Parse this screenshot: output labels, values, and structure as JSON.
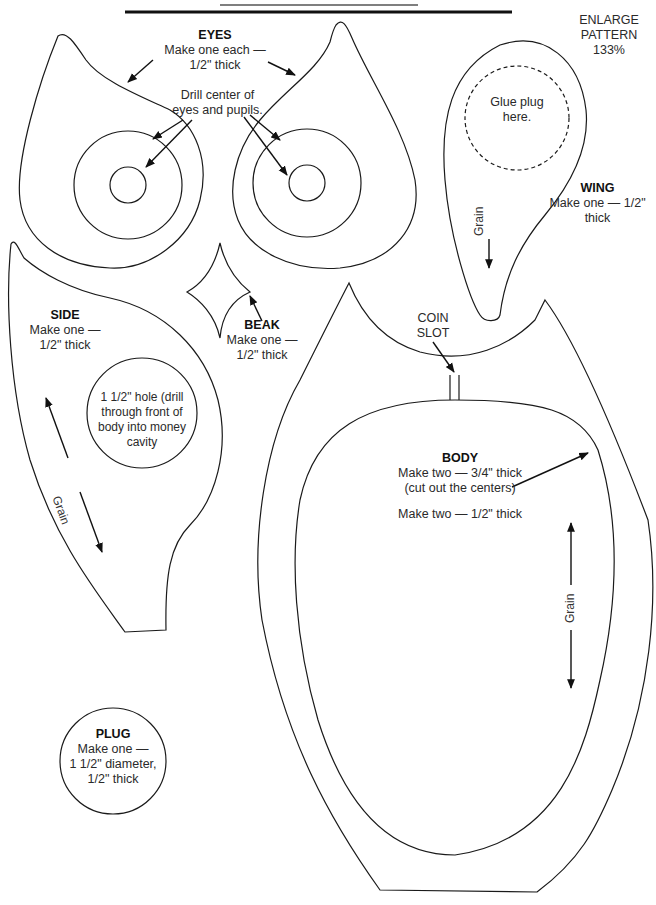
{
  "header": {
    "enlarge_note": [
      "ENLARGE",
      "PATTERN",
      "133%"
    ]
  },
  "pieces": {
    "eyes": {
      "title": "EYES",
      "lines": [
        "Make one each —",
        "1/2\" thick"
      ],
      "drill_note": [
        "Drill center of",
        "eyes and pupils."
      ]
    },
    "wing": {
      "title": "WING",
      "lines": [
        "Make one — 1/2\"",
        "thick"
      ],
      "glue_note": [
        "Glue plug",
        "here."
      ],
      "grain": "Grain"
    },
    "side": {
      "title": "SIDE",
      "lines": [
        "Make one —",
        "1/2\" thick"
      ],
      "hole_note": [
        "1 1/2\" hole (drill",
        "through front of",
        "body into money",
        "cavity"
      ],
      "grain": "Grain"
    },
    "beak": {
      "title": "BEAK",
      "lines": [
        "Make one —",
        "1/2\" thick"
      ]
    },
    "coin_slot": {
      "lines": [
        "COIN",
        "SLOT"
      ]
    },
    "body": {
      "title": "BODY",
      "lines": [
        "Make two — 3/4\" thick",
        "(cut out the centers)"
      ],
      "second_line": "Make two — 1/2\" thick",
      "grain": "Grain"
    },
    "plug": {
      "title": "PLUG",
      "lines": [
        "Make one —",
        "1 1/2\" diameter,",
        "1/2\" thick"
      ]
    }
  },
  "colors": {
    "line": "#1a1a1a",
    "text": "#2a2a2a",
    "background": "#ffffff"
  }
}
